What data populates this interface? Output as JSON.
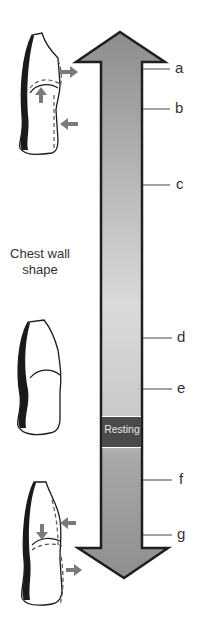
{
  "diagram": {
    "side_title_line1": "Chest wall",
    "side_title_line2": "shape",
    "band_label": "Resting",
    "markers": [
      {
        "label": "a",
        "y": 69
      },
      {
        "label": "b",
        "y": 109
      },
      {
        "label": "c",
        "y": 185
      },
      {
        "label": "d",
        "y": 338
      },
      {
        "label": "e",
        "y": 389
      },
      {
        "label": "f",
        "y": 480
      },
      {
        "label": "g",
        "y": 535
      }
    ],
    "illustrations": [
      {
        "name": "inspiration-shape",
        "position": "top",
        "arrows": [
          "outward-upper",
          "upward-diaphragm",
          "inward-lower"
        ]
      },
      {
        "name": "resting-shape",
        "position": "middle",
        "arrows": []
      },
      {
        "name": "expiration-shape",
        "position": "bottom",
        "arrows": [
          "inward-upper",
          "downward-diaphragm",
          "outward-lower"
        ]
      }
    ],
    "colors": {
      "arrow_top": "#8c8c8c",
      "arrow_mid": "#dadada",
      "arrow_bottom": "#8e8e8e",
      "outline": "#1e1e1e",
      "resting_band": "#4a4a4a",
      "indicator_arrow": "#7a7a7a"
    }
  }
}
